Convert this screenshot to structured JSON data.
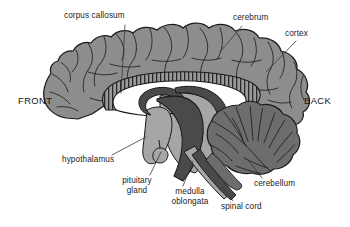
{
  "figure": {
    "background_color": "#ffffff"
  },
  "orientation": {
    "front": "FRONT",
    "back": "BACK"
  },
  "labels": [
    {
      "id": "corpus-callosum",
      "text": "corpus callosum",
      "lines": [
        "corpus callosum"
      ]
    },
    {
      "id": "cerebrum",
      "text": "cerebrum",
      "lines": [
        "cerebrum"
      ]
    },
    {
      "id": "cortex",
      "text": "cortex",
      "lines": [
        "cortex"
      ]
    },
    {
      "id": "hypothalamus",
      "text": "hypothalamus",
      "lines": [
        "hypothalamus"
      ]
    },
    {
      "id": "pituitary-gland",
      "text": "pituitary gland",
      "lines": [
        "pituitary",
        "gland"
      ]
    },
    {
      "id": "medulla-oblongata",
      "text": "medulla oblongata",
      "lines": [
        "medulla",
        "oblongata"
      ]
    },
    {
      "id": "spinal-cord",
      "text": "spinal cord",
      "lines": [
        "spinal cord"
      ]
    },
    {
      "id": "cerebellum",
      "text": "cerebellum",
      "lines": [
        "cerebellum"
      ]
    }
  ],
  "label_text": {
    "corpus_callosum": "corpus callosum",
    "cerebrum": "cerebrum",
    "cortex": "cortex",
    "hypothalamus": "hypothalamus",
    "pituitary_line1": "pituitary",
    "pituitary_line2": "gland",
    "medulla_line1": "medulla",
    "medulla_line2": "oblongata",
    "spinal_cord": "spinal cord",
    "cerebellum": "cerebellum"
  },
  "colors": {
    "cerebrum_fill": "#8d8d8d",
    "cerebellum_fill": "#6d6d6d",
    "brainstem_dark": "#4a4a4a",
    "midbrain_light": "#a6a6a6",
    "ventricle_white": "#ffffff",
    "outline": "#1a1a1a",
    "leader_line": "#3a3a3a",
    "text": "#1a1a1a",
    "background": "#ffffff"
  }
}
